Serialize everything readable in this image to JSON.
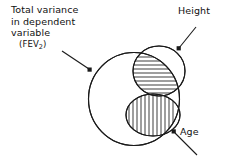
{
  "figure": {
    "type": "venn-diagram",
    "background_color": "#ffffff",
    "stroke_color": "#1a1a1a",
    "labels": {
      "total_variance": {
        "line1": "Total variance",
        "line2": "in dependent",
        "line3": "variable",
        "line4_prefix": "(FEV",
        "line4_subscript": "2",
        "line4_suffix": ")"
      },
      "height": "Height",
      "age": "Age"
    },
    "regions": [
      {
        "name": "total-variance-circle",
        "meaning": "Total variance in dependent variable (FEV2)",
        "fill": "none",
        "hatch": "none"
      },
      {
        "name": "height-circle",
        "meaning": "Height",
        "fill": "none",
        "hatch": "horizontal",
        "hatch_region": "overlap-with-total-variance"
      },
      {
        "name": "age-circle",
        "meaning": "Age",
        "fill": "none",
        "hatch": "vertical",
        "hatch_region": "overlap-with-total-variance"
      }
    ],
    "annotations": [
      {
        "name": "arrow-total-variance",
        "points_to": "total-variance-circle"
      },
      {
        "name": "arrow-height",
        "points_to": "height-circle"
      },
      {
        "name": "arrow-age",
        "points_to": "age-circle"
      }
    ]
  }
}
